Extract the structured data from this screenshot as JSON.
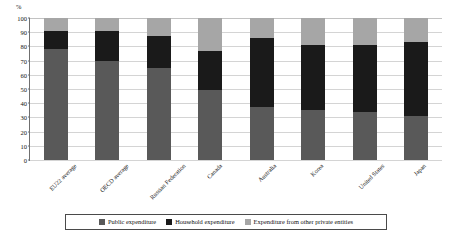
{
  "chart_data": {
    "type": "bar",
    "subtype": "stacked-bar-100-percent",
    "title": "",
    "xlabel": "",
    "ylabel": "%",
    "ylim": [
      0,
      100
    ],
    "yticks": [
      0,
      10,
      20,
      30,
      40,
      50,
      60,
      70,
      80,
      90,
      100
    ],
    "ytick_labels": [
      "0",
      "10",
      "20",
      "30",
      "40",
      "50",
      "60",
      "70",
      "80",
      "90",
      "100"
    ],
    "grid": true,
    "legend_position": "bottom",
    "categories": [
      "EU22 average",
      "OECD average",
      "Russian Federation",
      "Canada",
      "Australia",
      "Korea",
      "United States",
      "Japan"
    ],
    "series": [
      {
        "name": "Public expenditure",
        "color": "#595959",
        "values": [
          78,
          70,
          65,
          49,
          37,
          35,
          34,
          31
        ]
      },
      {
        "name": "Household expenditure",
        "color": "#1a1a1a",
        "values": [
          13,
          21,
          22,
          28,
          49,
          46,
          47,
          52
        ]
      },
      {
        "name": "Expenditure from other private entities",
        "color": "#a6a6a6",
        "values": [
          9,
          9,
          13,
          23,
          14,
          19,
          19,
          17
        ]
      }
    ],
    "cumulative_tops": {
      "public": [
        78,
        70,
        65,
        49,
        37,
        35,
        34,
        31
      ],
      "public_plus_household": [
        91,
        91,
        87,
        77,
        86,
        81,
        81,
        83
      ],
      "total": [
        100,
        100,
        100,
        100,
        100,
        100,
        100,
        100
      ]
    }
  },
  "axis": {
    "unit_label": "%"
  },
  "legend": {
    "items": [
      {
        "label": "Public expenditure",
        "swatch": "public"
      },
      {
        "label": "Household expenditure",
        "swatch": "household"
      },
      {
        "label": "Expenditure from other private entities",
        "swatch": "other"
      }
    ]
  },
  "colors": {
    "public": "#595959",
    "household": "#1a1a1a",
    "other": "#a6a6a6",
    "axis": "#6f6f6f",
    "grid": "#d4d4d4",
    "background": "#ffffff"
  }
}
